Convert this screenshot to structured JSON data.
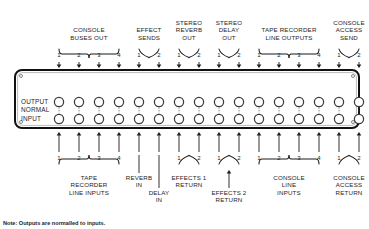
{
  "diagram": {
    "title_note": "Note: Outputs are normalled to inputs.",
    "panel": {
      "row_labels": [
        "OUTPUT",
        "NORMAL",
        "INPUT"
      ],
      "jack_columns": 16,
      "screws": 4
    },
    "top_groups": [
      {
        "label": "CONSOLE\nBUSES OUT",
        "numbers": [
          "1",
          "2",
          "3",
          "4"
        ],
        "start": 0,
        "span": 4,
        "brace": "wide"
      },
      {
        "label": "EFFECT\nSENDS",
        "numbers": [
          "1",
          "2"
        ],
        "start": 4,
        "span": 2,
        "brace": "narrow"
      },
      {
        "label": "STEREO\nREVERB\nOUT",
        "numbers": [
          "1",
          "2"
        ],
        "start": 6,
        "span": 2,
        "brace": "narrow"
      },
      {
        "label": "STEREO\nDELAY\nOUT",
        "numbers": [
          "1",
          "2"
        ],
        "start": 8,
        "span": 2,
        "brace": "narrow"
      },
      {
        "label": "TAPE RECORDER\nLINE OUTPUTS",
        "numbers": [
          "1",
          "2",
          "3",
          "4"
        ],
        "start": 10,
        "span": 4,
        "brace": "wide"
      },
      {
        "label": "CONSOLE\nACCESS\nSEND",
        "numbers": [
          "1",
          "2"
        ],
        "start": 14,
        "span": 2,
        "brace": "narrow"
      }
    ],
    "bottom_groups": [
      {
        "label": "TAPE\nRECORDER\nLINE INPUTS",
        "numbers": [
          "1",
          "2",
          "3",
          "4"
        ],
        "start": 0,
        "span": 4,
        "brace": "wide",
        "style": "below"
      },
      {
        "label": "REVERB\nIN",
        "numbers": [],
        "start": 4,
        "span": 1,
        "brace": "leader",
        "style": "leader-short"
      },
      {
        "label": "DELAY\nIN",
        "numbers": [],
        "start": 5,
        "span": 1,
        "brace": "leader",
        "style": "leader-long"
      },
      {
        "label": "EFFECTS 1\nRETURN",
        "numbers": [
          "1",
          "2"
        ],
        "start": 6,
        "span": 2,
        "brace": "narrow",
        "style": "below"
      },
      {
        "label": "EFFECTS 2\nRETURN",
        "numbers": [
          "1",
          "2"
        ],
        "start": 8,
        "span": 2,
        "brace": "narrow",
        "style": "arrow-leader"
      },
      {
        "label": "CONSOLE\nLINE\nINPUTS",
        "numbers": [
          "1",
          "2",
          "3",
          "4"
        ],
        "start": 10,
        "span": 4,
        "brace": "wide",
        "style": "below"
      },
      {
        "label": "CONSOLE\nACCESS\nRETURN",
        "numbers": [
          "1",
          "2"
        ],
        "start": 14,
        "span": 2,
        "brace": "narrow",
        "style": "below"
      }
    ],
    "colors": {
      "ink": "#1a1a1a",
      "panel_border": "#111111",
      "jack_ring": "#3a3a3a",
      "dotted": "#555555"
    }
  }
}
